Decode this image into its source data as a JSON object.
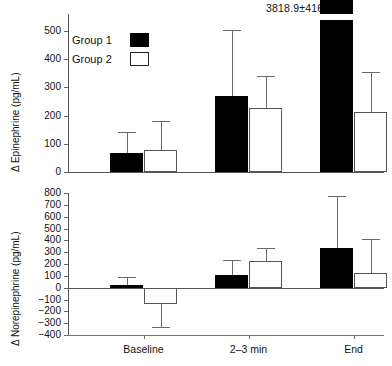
{
  "chart_data": {
    "type": "bar",
    "title": "",
    "categories": [
      "Baseline",
      "2–3 min",
      "End"
    ],
    "legend_position": "top-left",
    "grid": false,
    "panels": [
      {
        "id": "epinephrine",
        "ylabel": "Δ Epinephrine (pg/mL)",
        "ylim": [
          0,
          560
        ],
        "yticks": [
          0,
          100,
          200,
          300,
          400,
          500
        ],
        "ytick_labels": [
          "0",
          "100",
          "200",
          "300",
          "400",
          "500"
        ],
        "annotation": "3818.9±4162.9",
        "annotation_category": "End",
        "annotation_series": "Group 1",
        "series": [
          {
            "name": "Group 1",
            "fill": "#000000",
            "values": [
              66,
              270,
              3818.9
            ],
            "errors": [
              75,
              233,
              4162.9
            ],
            "error_upper": [
              141,
              503,
              null
            ],
            "broken_axis": [
              false,
              false,
              true
            ]
          },
          {
            "name": "Group 2",
            "fill": "#ffffff",
            "values": [
              78,
              228,
              213
            ],
            "errors": [
              104,
              114,
              142
            ],
            "error_upper": [
              182,
              342,
              355
            ],
            "broken_axis": [
              false,
              false,
              false
            ]
          }
        ]
      },
      {
        "id": "norepinephrine",
        "ylabel": "Δ Norepinephrine (pg/mL)",
        "ylim": [
          -400,
          800
        ],
        "yticks": [
          -400,
          -300,
          -200,
          -100,
          0,
          100,
          200,
          300,
          400,
          500,
          600,
          700,
          800
        ],
        "ytick_labels": [
          "−400",
          "−300",
          "−200",
          "−100",
          "0",
          "100",
          "200",
          "300",
          "400",
          "500",
          "600",
          "700",
          "800"
        ],
        "annotation": "",
        "series": [
          {
            "name": "Group 1",
            "fill": "#000000",
            "values": [
              25,
              103,
              337
            ],
            "errors": [
              65,
              128,
              440
            ],
            "error_upper": [
              90,
              231,
              777
            ],
            "error_lower": [
              null,
              null,
              null
            ]
          },
          {
            "name": "Group 2",
            "fill": "#ffffff",
            "values": [
              -140,
              228,
              120
            ],
            "errors": [
              195,
              108,
              290
            ],
            "error_upper": [
              null,
              336,
              410
            ],
            "error_lower": [
              -335,
              null,
              null
            ]
          }
        ]
      }
    ],
    "legend": [
      {
        "label": "Group 1",
        "style": "filled"
      },
      {
        "label": "Group 2",
        "style": "open"
      }
    ]
  }
}
